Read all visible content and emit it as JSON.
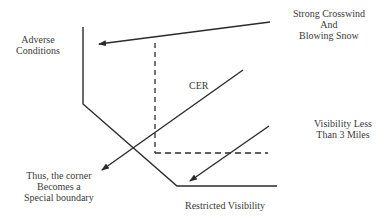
{
  "diagram": {
    "labels": {
      "adverse_line1": "Adverse",
      "adverse_line2": "Conditions",
      "crosswind_line1": "Strong Crosswind",
      "crosswind_line2": "And",
      "crosswind_line3": "Blowing Snow",
      "cer": "CER",
      "visibility_line1": "Visibility Less",
      "visibility_line2": "Than 3 Miles",
      "corner_line1": "Thus, the corner",
      "corner_line2": "Becomes a",
      "corner_line3": "Special boundary",
      "restricted": "Restricted Visibility"
    },
    "colors": {
      "line": "#2b2b2b",
      "text": "#3a3a3a",
      "background": "#ffffff"
    }
  }
}
